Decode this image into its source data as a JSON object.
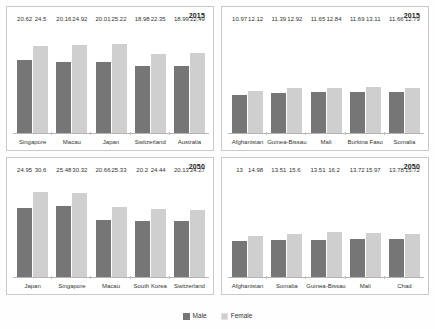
{
  "legend": {
    "items": [
      {
        "label": "Male",
        "color": "#767676",
        "key": "male"
      },
      {
        "label": "Female",
        "color": "#cfcfcf",
        "key": "female"
      }
    ]
  },
  "colors": {
    "male": "#767676",
    "female": "#cfcfcf",
    "panel_border": "#c9c9c9",
    "axis": "#b5b5b5",
    "background": "#ffffff"
  },
  "panels": [
    {
      "id": "top-left",
      "year": "2015",
      "categories": [
        "Singapore",
        "Macau",
        "Japan",
        "Switzerland",
        "Australia"
      ],
      "male": [
        20.62,
        20.16,
        20.01,
        18.98,
        18.99
      ],
      "female": [
        24.5,
        24.92,
        25.22,
        22.35,
        22.49
      ],
      "male_labels": [
        "20.62",
        "20.16",
        "20.01",
        "18.98",
        "18.99"
      ],
      "female_labels": [
        "24.5",
        "24.92",
        "25.22",
        "22.35",
        "22.49"
      ],
      "ymax": 31
    },
    {
      "id": "top-right",
      "year": "2015",
      "categories": [
        "Afghanistan",
        "Guinea-Bissau",
        "Mali",
        "Burkina Faso",
        "Somalia"
      ],
      "male": [
        10.97,
        11.39,
        11.65,
        11.69,
        11.66
      ],
      "female": [
        12.12,
        12.92,
        12.84,
        13.11,
        12.79
      ],
      "male_labels": [
        "10.97",
        "11.39",
        "11.65",
        "11.69",
        "11.66"
      ],
      "female_labels": [
        "12.12",
        "12.92",
        "12.84",
        "13.11",
        "12.79"
      ],
      "ymax": 31
    },
    {
      "id": "bottom-left",
      "year": "2050",
      "categories": [
        "Japan",
        "Singapore",
        "Macau",
        "South Korea",
        "Switzerland"
      ],
      "male": [
        24.95,
        25.48,
        20.66,
        20.2,
        20.13
      ],
      "female": [
        30.6,
        30.32,
        25.33,
        24.44,
        24.27
      ],
      "male_labels": [
        "24.95",
        "25.48",
        "20.66",
        "20.2",
        "20.13"
      ],
      "female_labels": [
        "30.6",
        "30.32",
        "25.33",
        "24.44",
        "24.27"
      ],
      "ymax": 37
    },
    {
      "id": "bottom-right",
      "year": "2050",
      "categories": [
        "Afghanistan",
        "Somalia",
        "Guinea-Bissau",
        "Mali",
        "Chad"
      ],
      "male": [
        13,
        13.51,
        13.51,
        13.72,
        13.78
      ],
      "female": [
        14.98,
        15.6,
        16.2,
        15.97,
        15.72
      ],
      "male_labels": [
        "13",
        "13.51",
        "13.51",
        "13.72",
        "13.78"
      ],
      "female_labels": [
        "14.98",
        "15.6",
        "16.2",
        "15.97",
        "15.72"
      ],
      "ymax": 37
    }
  ],
  "chart_data": [
    {
      "type": "bar",
      "title": "2015",
      "subtitle": "Highest median age countries, 2015",
      "categories": [
        "Singapore",
        "Macau",
        "Japan",
        "Switzerland",
        "Australia"
      ],
      "series": [
        {
          "name": "Male",
          "values": [
            20.62,
            20.16,
            20.01,
            18.98,
            18.99
          ]
        },
        {
          "name": "Female",
          "values": [
            24.5,
            24.92,
            25.22,
            22.35,
            22.49
          ]
        }
      ],
      "xlabel": "",
      "ylabel": "",
      "ylim": [
        0,
        31
      ],
      "grid": false,
      "legend": "bottom"
    },
    {
      "type": "bar",
      "title": "2015",
      "subtitle": "Lowest median age countries, 2015",
      "categories": [
        "Afghanistan",
        "Guinea-Bissau",
        "Mali",
        "Burkina Faso",
        "Somalia"
      ],
      "series": [
        {
          "name": "Male",
          "values": [
            10.97,
            11.39,
            11.65,
            11.69,
            11.66
          ]
        },
        {
          "name": "Female",
          "values": [
            12.12,
            12.92,
            12.84,
            13.11,
            12.79
          ]
        }
      ],
      "xlabel": "",
      "ylabel": "",
      "ylim": [
        0,
        31
      ],
      "grid": false,
      "legend": "bottom"
    },
    {
      "type": "bar",
      "title": "2050",
      "subtitle": "Highest median age countries, 2050",
      "categories": [
        "Japan",
        "Singapore",
        "Macau",
        "South Korea",
        "Switzerland"
      ],
      "series": [
        {
          "name": "Male",
          "values": [
            24.95,
            25.48,
            20.66,
            20.2,
            20.13
          ]
        },
        {
          "name": "Female",
          "values": [
            30.6,
            30.32,
            25.33,
            24.44,
            24.27
          ]
        }
      ],
      "xlabel": "",
      "ylabel": "",
      "ylim": [
        0,
        37
      ],
      "grid": false,
      "legend": "bottom"
    },
    {
      "type": "bar",
      "title": "2050",
      "subtitle": "Lowest median age countries, 2050",
      "categories": [
        "Afghanistan",
        "Somalia",
        "Guinea-Bissau",
        "Mali",
        "Chad"
      ],
      "series": [
        {
          "name": "Male",
          "values": [
            13,
            13.51,
            13.51,
            13.72,
            13.78
          ]
        },
        {
          "name": "Female",
          "values": [
            14.98,
            15.6,
            16.2,
            15.97,
            15.72
          ]
        }
      ],
      "xlabel": "",
      "ylabel": "",
      "ylim": [
        0,
        37
      ],
      "grid": false,
      "legend": "bottom"
    }
  ]
}
